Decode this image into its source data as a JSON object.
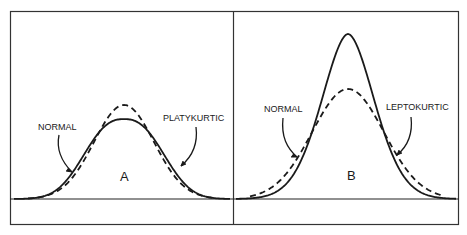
{
  "panels": [
    {
      "id": "A",
      "letter": "A",
      "reference_label": "NORMAL",
      "comparison_label": "PLATYKURTIC",
      "comparison_relative_peak": 0.85,
      "comparison_relative_width": 1.25
    },
    {
      "id": "B",
      "letter": "B",
      "reference_label": "NORMAL",
      "comparison_label": "LEPTOKURTIC",
      "comparison_relative_peak": 1.5,
      "comparison_relative_width": 0.72
    }
  ],
  "legend": {
    "reference_style": "dashed",
    "comparison_style": "solid"
  },
  "colors": {
    "ink": "#1a1a1a",
    "background": "#ffffff"
  }
}
